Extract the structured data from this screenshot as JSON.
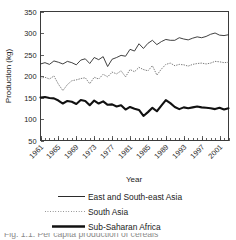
{
  "chart_data": {
    "type": "line",
    "title": "",
    "xlabel": "Year",
    "ylabel": "Production (kg)",
    "ylim": [
      50,
      350
    ],
    "ytick_labels": [
      "350",
      "300",
      "250",
      "200",
      "150",
      "100",
      "50"
    ],
    "ytick_values": [
      350,
      300,
      250,
      200,
      150,
      100,
      50
    ],
    "xlim": [
      1961,
      2003
    ],
    "xtick_labels": [
      "1961",
      "1965",
      "1969",
      "1973",
      "1977",
      "1981",
      "1985",
      "1989",
      "1993",
      "1997",
      "2001"
    ],
    "xtick_values": [
      1961,
      1965,
      1969,
      1973,
      1977,
      1981,
      1985,
      1989,
      1993,
      1997,
      2001
    ],
    "minor_ticks": "every year",
    "grid": false,
    "legend_position": "below-plot",
    "x": [
      1961,
      1962,
      1963,
      1964,
      1965,
      1966,
      1967,
      1968,
      1969,
      1970,
      1971,
      1972,
      1973,
      1974,
      1975,
      1976,
      1977,
      1978,
      1979,
      1980,
      1981,
      1982,
      1983,
      1984,
      1985,
      1986,
      1987,
      1988,
      1989,
      1990,
      1991,
      1992,
      1993,
      1994,
      1995,
      1996,
      1997,
      1998,
      1999,
      2000,
      2001,
      2002,
      2003
    ],
    "series": [
      {
        "name": "East and South-east Asia",
        "style": "solid-thin",
        "color": "#2b2b2b",
        "values": [
          228,
          231,
          227,
          235,
          232,
          228,
          234,
          231,
          226,
          237,
          240,
          229,
          243,
          238,
          245,
          222,
          239,
          243,
          248,
          246,
          262,
          258,
          275,
          264,
          276,
          283,
          273,
          280,
          285,
          283,
          283,
          289,
          286,
          284,
          288,
          291,
          289,
          292,
          297,
          300,
          295,
          294,
          296
        ]
      },
      {
        "name": "South Asia",
        "style": "dotted",
        "color": "#6d6d6d",
        "values": [
          195,
          197,
          193,
          200,
          181,
          166,
          180,
          189,
          191,
          194,
          196,
          182,
          197,
          193,
          204,
          198,
          209,
          205,
          212,
          198,
          215,
          210,
          220,
          215,
          212,
          224,
          202,
          216,
          227,
          230,
          224,
          227,
          226,
          223,
          227,
          229,
          230,
          228,
          230,
          234,
          233,
          231,
          232
        ]
      },
      {
        "name": "Sub-Saharan Africa",
        "style": "solid-thick",
        "color": "#111111",
        "values": [
          150,
          151,
          149,
          148,
          143,
          136,
          142,
          140,
          135,
          144,
          142,
          132,
          143,
          136,
          141,
          133,
          134,
          129,
          132,
          122,
          128,
          124,
          121,
          107,
          116,
          126,
          118,
          131,
          144,
          137,
          128,
          123,
          127,
          125,
          127,
          129,
          127,
          126,
          125,
          123,
          126,
          122,
          125
        ]
      }
    ]
  },
  "legend": {
    "entries": [
      {
        "label": "East and South-east Asia",
        "style": "solid-thin"
      },
      {
        "label": "South Asia",
        "style": "dotted"
      },
      {
        "label": "Sub-Saharan Africa",
        "style": "solid-thick"
      }
    ]
  },
  "caption": {
    "text": "Fig. 1.1.   Per capita production of cereals"
  }
}
